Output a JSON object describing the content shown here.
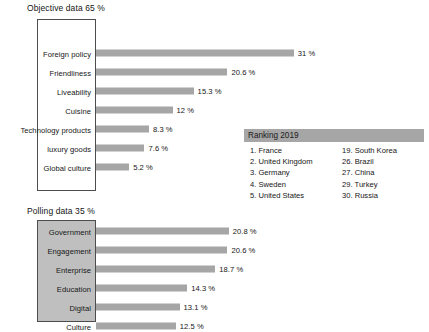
{
  "chart_data": [
    {
      "type": "bar",
      "orientation": "horizontal",
      "title": "Objective data 65  %",
      "xlabel": "",
      "ylabel": "",
      "unit": "%",
      "grid": false,
      "legend": "none",
      "xlim": [
        0,
        31
      ],
      "categories": [
        "Foreign policy",
        "Friendliness",
        "Liveability",
        "Cuisine",
        "Technology products",
        "luxury goods",
        "Global culture"
      ],
      "values": [
        31,
        20.6,
        15.3,
        12,
        8.3,
        7.6,
        5.2
      ],
      "value_labels": [
        "31 %",
        "20.6 %",
        "15.3 %",
        "12 %",
        "8.3 %",
        "7.6 %",
        "5.2 %"
      ],
      "bar_color": "#a6a6a6"
    },
    {
      "type": "bar",
      "orientation": "horizontal",
      "title": "Polling data 35 %",
      "xlabel": "",
      "ylabel": "",
      "unit": "%",
      "grid": false,
      "legend": "none",
      "xlim": [
        0,
        31
      ],
      "categories": [
        "Government",
        "Engagement",
        "Enterprise",
        "Education",
        "Digital",
        "Culture"
      ],
      "values": [
        20.8,
        20.6,
        18.7,
        14.3,
        13.1,
        12.5
      ],
      "value_labels": [
        "20.8 %",
        "20.6 %",
        "18.7 %",
        "14.3 %",
        "13.1 %",
        "12.5 %"
      ],
      "bar_color": "#a6a6a6",
      "category_box_color": "#bfbfbf"
    }
  ],
  "charts": {
    "objective": {
      "title": "Objective data 65  %",
      "rows": [
        {
          "label": "Foreign policy",
          "value": "31 %"
        },
        {
          "label": "Friendliness",
          "value": "20.6 %"
        },
        {
          "label": "Liveability",
          "value": "15.3 %"
        },
        {
          "label": "Cuisine",
          "value": "12 %"
        },
        {
          "label": "Technology products",
          "value": "8.3 %"
        },
        {
          "label": "luxury goods",
          "value": "7.6 %"
        },
        {
          "label": "Global culture",
          "value": "5.2 %"
        }
      ]
    },
    "polling": {
      "title": "Polling data 35 %",
      "rows": [
        {
          "label": "Government",
          "value": "20.8 %"
        },
        {
          "label": "Engagement",
          "value": "20.6 %"
        },
        {
          "label": "Enterprise",
          "value": "18.7 %"
        },
        {
          "label": "Education",
          "value": "14.3 %"
        },
        {
          "label": "Digital",
          "value": "13.1 %"
        },
        {
          "label": "Culture",
          "value": "12.5 %"
        }
      ]
    }
  },
  "ranking": {
    "header": "Ranking 2019",
    "left_column": [
      "1. France",
      "2. United Kingdom",
      "3. Germany",
      "4. Sweden",
      "5. United States"
    ],
    "right_column": [
      "19. South Korea",
      "26. Brazil",
      "27. China",
      "29. Turkey",
      "30. Russia"
    ]
  },
  "colors": {
    "bar": "#a6a6a6",
    "ranking_header": "#a6a6a6",
    "polling_box": "#bfbfbf",
    "box_border": "#4d4d4d",
    "text": "#161616",
    "background": "#ffffff"
  }
}
